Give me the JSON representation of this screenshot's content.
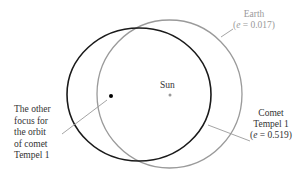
{
  "diagram": {
    "colors": {
      "comet_orbit": "#1a1a1a",
      "earth_orbit": "#9a9a9a",
      "leader_line": "#9a9a9a",
      "text_dark": "#333333",
      "text_gray": "#9a9a9a"
    },
    "sun": {
      "label": "Sun"
    },
    "earth": {
      "name": "Earth",
      "ecc_prefix": "(",
      "ecc_symbol": "e",
      "ecc_value": " = 0.017)"
    },
    "comet": {
      "name_line1": "Comet",
      "name_line2": "Tempel 1",
      "ecc_prefix": "(",
      "ecc_symbol": "e",
      "ecc_value": " = 0.519)"
    },
    "focus_label": {
      "lines": [
        "The other",
        "focus for",
        "the orbit",
        "of comet",
        "Tempel 1"
      ]
    }
  }
}
